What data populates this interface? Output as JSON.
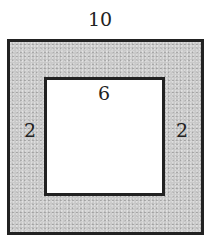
{
  "diagram": {
    "type": "square frame (shaded border region between two concentric squares)",
    "outer_square": {
      "side_label": "10",
      "fill": "#c9c9c9",
      "stroke": "#222222"
    },
    "inner_square": {
      "side_label": "6",
      "fill": "#ffffff",
      "stroke": "#222222"
    },
    "border_width_labels": {
      "left": "2",
      "right": "2"
    }
  }
}
